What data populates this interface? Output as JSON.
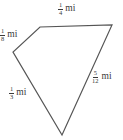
{
  "diagram": {
    "type": "quadrilateral",
    "stroke_color": "#555555",
    "vertices": {
      "top_left": [
        40,
        27
      ],
      "top_right": [
        112,
        25
      ],
      "bottom": [
        62,
        135
      ],
      "left": [
        13,
        52
      ]
    },
    "sides": [
      {
        "id": "top",
        "numerator": "1",
        "denominator": "4",
        "unit": "mi"
      },
      {
        "id": "upper_left",
        "numerator": "1",
        "denominator": "8",
        "unit": "mi"
      },
      {
        "id": "right",
        "numerator": "5",
        "denominator": "12",
        "unit": "mi"
      },
      {
        "id": "lower_left",
        "numerator": "1",
        "denominator": "3",
        "unit": "mi"
      }
    ]
  }
}
